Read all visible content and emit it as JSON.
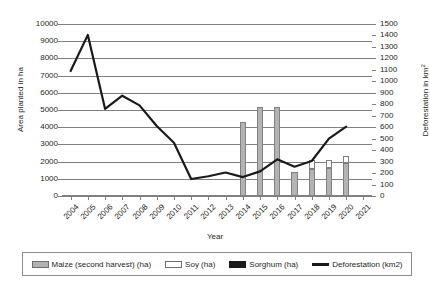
{
  "chart_data": {
    "type": "bar",
    "title": "",
    "xlabel": "Year",
    "ylabel": "Area planted in ha",
    "y2label": "Deforestation in km2",
    "grid": true,
    "legend_position": "bottom",
    "categories": [
      "2004",
      "2005",
      "2006",
      "2007",
      "2008",
      "2009",
      "2010",
      "2011",
      "2012",
      "2013",
      "2014",
      "2015",
      "2016",
      "2017",
      "2018",
      "2019",
      "2020",
      "2021"
    ],
    "ylim": [
      0,
      10000
    ],
    "yticks": [
      "0",
      "1000",
      "2000",
      "3000",
      "4000",
      "5000",
      "6000",
      "7000",
      "8000",
      "9000",
      "10000"
    ],
    "y2lim": [
      0,
      1500
    ],
    "y2ticks": [
      "0",
      "100",
      "200",
      "300",
      "400",
      "500",
      "600",
      "700",
      "800",
      "900",
      "1000",
      "1100",
      "1200",
      "1300",
      "1400",
      "1500"
    ],
    "series": [
      {
        "name": "Maize (second harvest) (ha)",
        "kind": "bar",
        "stack": "crops",
        "color": "#b3b3b3",
        "axis": "left",
        "values": [
          null,
          null,
          null,
          null,
          null,
          null,
          null,
          null,
          null,
          null,
          4300,
          5200,
          5200,
          1400,
          1550,
          1600,
          1900,
          null
        ]
      },
      {
        "name": "Soy (ha)",
        "kind": "bar",
        "stack": "crops",
        "color": "#ffffff",
        "axis": "left",
        "values": [
          null,
          null,
          null,
          null,
          null,
          null,
          null,
          null,
          null,
          null,
          0,
          0,
          0,
          0,
          550,
          500,
          450,
          null
        ]
      },
      {
        "name": "Sorghum (ha)",
        "kind": "bar",
        "stack": "crops",
        "color": "#1a1a1a",
        "axis": "left",
        "values": [
          null,
          null,
          null,
          null,
          null,
          null,
          null,
          null,
          null,
          null,
          0,
          0,
          0,
          0,
          0,
          0,
          0,
          null
        ]
      },
      {
        "name": "Deforestation (km2)",
        "kind": "line",
        "color": "#1a1a1a",
        "axis": "right",
        "values": [
          1090,
          1405,
          760,
          875,
          790,
          610,
          465,
          148,
          172,
          205,
          165,
          215,
          320,
          255,
          305,
          500,
          605,
          null
        ]
      }
    ]
  },
  "legend": {
    "items": [
      {
        "label": "Maize (second harvest) (ha)",
        "swatch": "maize-swatch"
      },
      {
        "label": "Soy (ha)",
        "swatch": "soy-swatch"
      },
      {
        "label": "Sorghum (ha)",
        "swatch": "sorghum-swatch"
      },
      {
        "label": "Deforestation (km2)",
        "swatch": "deforestation-line-swatch"
      }
    ]
  },
  "axes": {
    "y_left_title": "Area planted in ha",
    "y_right_title_main": "Deforestation in km",
    "y_right_title_sup": "2",
    "x_title": "Year"
  }
}
